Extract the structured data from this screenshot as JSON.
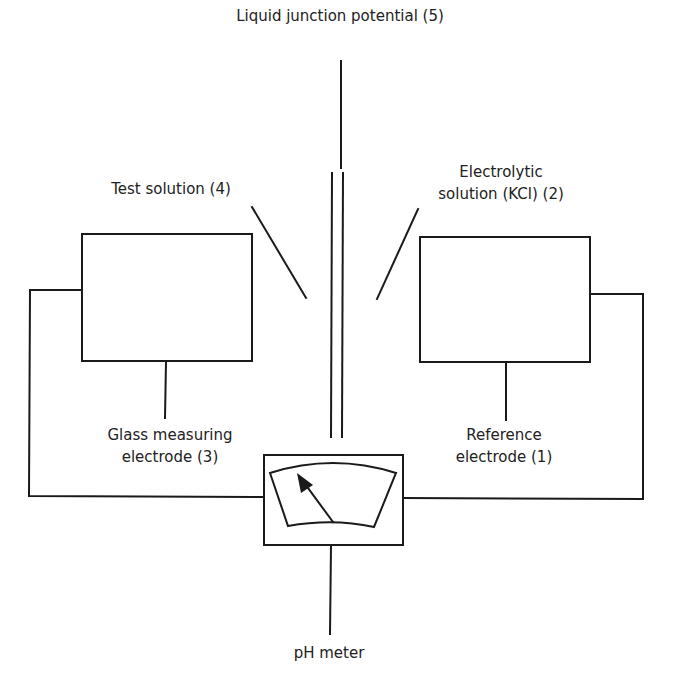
{
  "diagram": {
    "colors": {
      "line": "#1a1a1a",
      "text": "#222222",
      "background": "#ffffff"
    },
    "labels": {
      "liquid_junction": "Liquid junction potential (5)",
      "test_solution": "Test solution (4)",
      "electrolytic_line1": "Electrolytic",
      "electrolytic_line2": "solution (KCl) (2)",
      "glass_line1": "Glass measuring",
      "glass_line2": "electrode (3)",
      "reference_line1": "Reference",
      "reference_line2": "electrode (1)",
      "ph_meter": "pH meter"
    },
    "components": [
      {
        "id": "glass-measuring-electrode",
        "number": 3
      },
      {
        "id": "reference-electrode",
        "number": 1
      },
      {
        "id": "electrolytic-solution",
        "number": 2
      },
      {
        "id": "test-solution",
        "number": 4
      },
      {
        "id": "liquid-junction-potential",
        "number": 5
      },
      {
        "id": "ph-meter"
      }
    ]
  }
}
